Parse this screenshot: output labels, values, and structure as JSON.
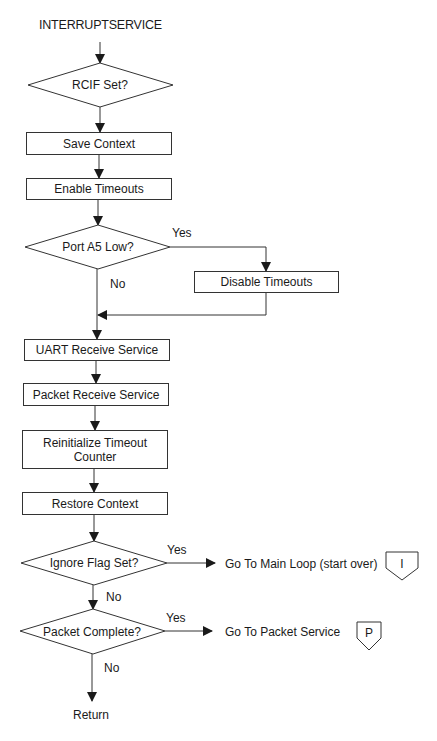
{
  "diagram": {
    "title": "INTERRUPTSERVICE",
    "nodes": {
      "rcif": {
        "type": "decision",
        "label": "RCIF Set?"
      },
      "save_context": {
        "type": "process",
        "label": "Save Context"
      },
      "enable_timeouts": {
        "type": "process",
        "label": "Enable Timeouts"
      },
      "port_a5": {
        "type": "decision",
        "label": "Port A5 Low?",
        "yes_label": "Yes",
        "no_label": "No"
      },
      "disable_timeouts": {
        "type": "process",
        "label": "Disable Timeouts"
      },
      "uart_receive": {
        "type": "process",
        "label": "UART Receive Service"
      },
      "packet_receive": {
        "type": "process",
        "label": "Packet Receive Service"
      },
      "reinit_timeout": {
        "type": "process",
        "label_line1": "Reinitialize Timeout",
        "label_line2": "Counter"
      },
      "restore_context": {
        "type": "process",
        "label": "Restore Context"
      },
      "ignore_flag": {
        "type": "decision",
        "label": "Ignore Flag Set?",
        "yes_label": "Yes",
        "no_label": "No"
      },
      "main_loop": {
        "type": "terminal-text",
        "label": "Go To Main Loop (start over)",
        "connector": "I"
      },
      "packet_complete": {
        "type": "decision",
        "label": "Packet Complete?",
        "yes_label": "Yes",
        "no_label": "No"
      },
      "packet_service": {
        "type": "terminal-text",
        "label": "Go To Packet Service",
        "connector": "P"
      },
      "return": {
        "type": "terminal-text",
        "label": "Return"
      }
    },
    "colors": {
      "line": "#333333",
      "background": "#ffffff",
      "text": "#1a1a1a"
    }
  }
}
